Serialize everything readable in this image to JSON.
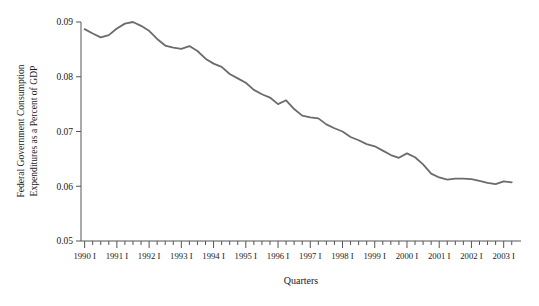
{
  "chart_data": {
    "type": "line",
    "title": "",
    "xlabel": "Quarters",
    "ylabel": "Federal Government Consumption Expenditures as a Percent of GDP",
    "ylabel_lines": [
      "Federal Government Consumption",
      "Expenditures as a Percent of GDP"
    ],
    "ylim": [
      0.05,
      0.09
    ],
    "ytick_labels": [
      "0.05",
      "0.06",
      "0.07",
      "0.08",
      "0.09"
    ],
    "ytick_values": [
      0.05,
      0.06,
      0.07,
      0.08,
      0.09
    ],
    "grid": false,
    "legend": "none",
    "line_color": "#6b6b6b",
    "axis_color": "#555555",
    "xtick_labels": [
      "1990 I",
      "1991 I",
      "1992 I",
      "1993 I",
      "1994 I",
      "1995 I",
      "1996 I",
      "1997 I",
      "1998 I",
      "1999 I",
      "2000 I",
      "2001 I",
      "2002 I",
      "2003 I"
    ],
    "x_start_label": "1990 I",
    "x_end_label": "2003 I",
    "quarter_labels": [
      "1990 I",
      "1990 II",
      "1990 III",
      "1990 IV",
      "1991 I",
      "1991 II",
      "1991 III",
      "1991 IV",
      "1992 I",
      "1992 II",
      "1992 III",
      "1992 IV",
      "1993 I",
      "1993 II",
      "1993 III",
      "1993 IV",
      "1994 I",
      "1994 II",
      "1994 III",
      "1994 IV",
      "1995 I",
      "1995 II",
      "1995 III",
      "1995 IV",
      "1996 I",
      "1996 II",
      "1996 III",
      "1996 IV",
      "1997 I",
      "1997 II",
      "1997 III",
      "1997 IV",
      "1998 I",
      "1998 II",
      "1998 III",
      "1998 IV",
      "1999 I",
      "1999 II",
      "1999 III",
      "1999 IV",
      "2000 I",
      "2000 II",
      "2000 III",
      "2000 IV",
      "2001 I",
      "2001 II",
      "2001 III",
      "2001 IV",
      "2002 I",
      "2002 II",
      "2002 III",
      "2002 IV",
      "2003 I",
      "2003 II"
    ],
    "values": [
      0.0887,
      0.0879,
      0.0872,
      0.0876,
      0.0888,
      0.0897,
      0.09,
      0.0893,
      0.0884,
      0.0869,
      0.0857,
      0.0853,
      0.0851,
      0.0856,
      0.0847,
      0.0833,
      0.0824,
      0.0818,
      0.0805,
      0.0797,
      0.0789,
      0.0776,
      0.0768,
      0.0762,
      0.075,
      0.0757,
      0.0741,
      0.0729,
      0.0726,
      0.0724,
      0.0713,
      0.0706,
      0.07,
      0.069,
      0.0684,
      0.0677,
      0.0673,
      0.0665,
      0.0657,
      0.0652,
      0.066,
      0.0653,
      0.064,
      0.0623,
      0.0616,
      0.0612,
      0.0614,
      0.0614,
      0.0613,
      0.061,
      0.0606,
      0.0604,
      0.0609,
      0.0607
    ],
    "annotations": []
  }
}
